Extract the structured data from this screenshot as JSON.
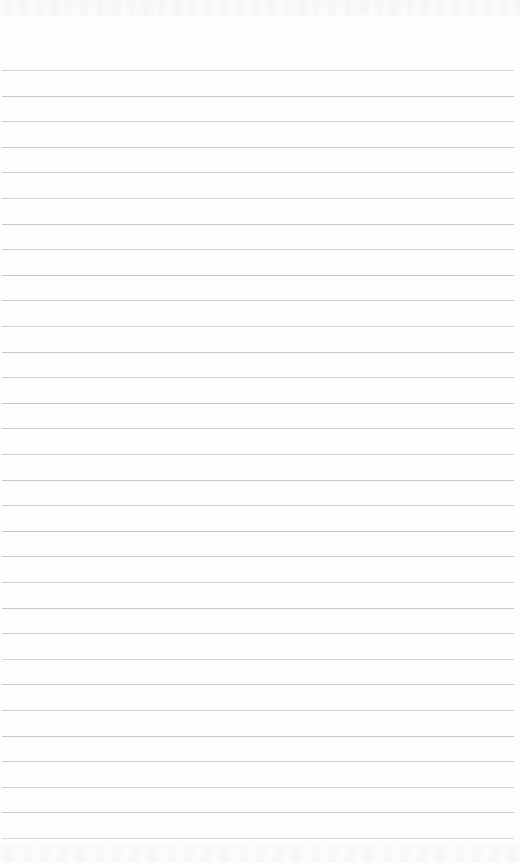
{
  "document": {
    "kind": "ruled-notebook-paper",
    "description": "Blank lined notebook page, scanned",
    "page_width": 520,
    "page_height": 863,
    "background_color": "#fefefe",
    "has_handwriting": false,
    "has_margin_rule": false,
    "text_content": ""
  },
  "ruling": {
    "line_color": "#bfc3c7",
    "line_thickness": 1,
    "line_spacing": 25.6,
    "first_line_y": 70,
    "last_line_y": 838,
    "line_start_x": 2,
    "line_end_x": 514,
    "line_count": 31,
    "lines_y": [
      70,
      95.6,
      121.2,
      146.8,
      172.4,
      198,
      223.6,
      249.2,
      274.8,
      300.4,
      326,
      351.6,
      377.2,
      402.8,
      428.4,
      454,
      479.6,
      505.2,
      530.8,
      556.4,
      582,
      607.6,
      633.2,
      658.8,
      684.4,
      710,
      735.6,
      761.2,
      786.8,
      812.4,
      838
    ]
  },
  "artifacts": {
    "top_band": {
      "y": 0,
      "height": 15,
      "tone": "#f4f4f7"
    },
    "bottom_band": {
      "y": 845,
      "height": 18,
      "tone": "#f5f5f8"
    }
  }
}
